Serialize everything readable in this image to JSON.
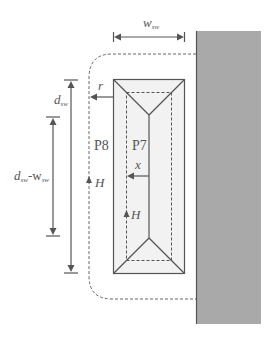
{
  "diagram": {
    "colors": {
      "wall_fill": "#a9a9a9",
      "wall_edge": "#555555",
      "line": "#555555",
      "box_fill": "#f2f2f2",
      "dashed": "#666666"
    },
    "labels": {
      "w_sw": "w",
      "w_sw_sub": "sw",
      "d_sw": "d",
      "d_sw_sub": "sw",
      "d_minus_w_d": "d",
      "d_minus_w_d_sub": "sw",
      "d_minus_w_dash": "-w",
      "d_minus_w_w_sub": "sw",
      "r": "r",
      "p8": "P8",
      "p7": "P7",
      "x": "x",
      "h_outer": "H",
      "h_inner": "H"
    }
  }
}
